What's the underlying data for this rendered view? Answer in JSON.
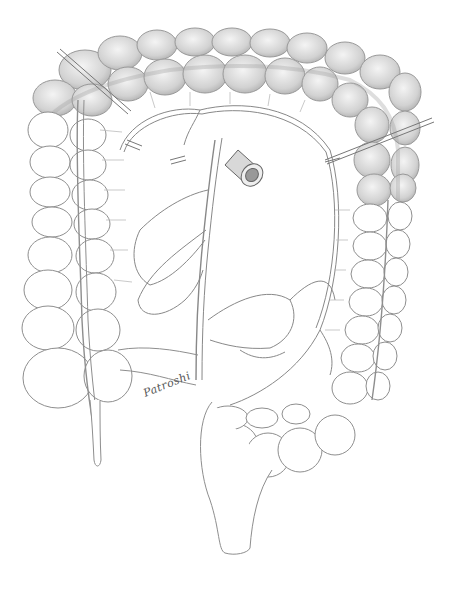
{
  "illustration": {
    "subject": "colon-with-stoma pencil drawing",
    "signature": "Patroshi",
    "colors": {
      "background": "#ffffff",
      "line": "#8a8a8a",
      "shade_dark": "#b8b8b8",
      "shade_light": "#dcdcdc"
    }
  }
}
